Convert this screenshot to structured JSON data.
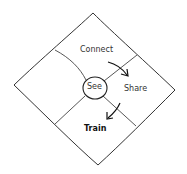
{
  "diagram": {
    "center": {
      "label": "See"
    },
    "quadrants": [
      {
        "position": "top",
        "label": "Connect"
      },
      {
        "position": "right",
        "label": "Share"
      },
      {
        "position": "bottom",
        "label": "Train",
        "emphasis": "bold"
      },
      {
        "position": "left",
        "label": ""
      }
    ],
    "arrows": [
      {
        "from": "Connect",
        "to": "Share"
      },
      {
        "from": "Share",
        "to": "Train"
      }
    ],
    "colors": {
      "stroke": "#333333",
      "background": "#ffffff"
    }
  }
}
